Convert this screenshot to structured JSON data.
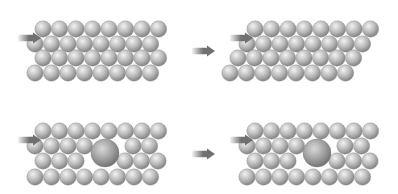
{
  "colors": {
    "background": "#ffffff",
    "sphere_light": "#f2f2f2",
    "sphere_mid": "#b8b8b8",
    "sphere_dark": "#7c7c7c",
    "big_sphere_light": "#d8d8d8",
    "big_sphere_mid": "#9a9a9a",
    "big_sphere_dark": "#6c6c6c",
    "arrow_light": "#f4f4f4",
    "arrow_dark": "#707070"
  },
  "sphere_radius": 8.2,
  "panels": [
    {
      "name": "perfect-lattice-before-slip",
      "rows": [
        {
          "y": 29,
          "x": [
            43,
            59.5,
            76,
            92.5,
            109,
            125.5,
            142,
            158.5
          ]
        },
        {
          "y": 44,
          "x": [
            35,
            51.5,
            68,
            84.5,
            101,
            117.5,
            134,
            150.5
          ]
        },
        {
          "y": 58,
          "x": [
            43,
            59.5,
            76,
            92.5,
            109,
            125.5,
            142,
            158.5
          ]
        },
        {
          "y": 73,
          "x": [
            35,
            51.5,
            68,
            84.5,
            101,
            117.5,
            134,
            150.5
          ]
        }
      ],
      "big": [],
      "push_arrow": {
        "x1": 18,
        "x2": 41,
        "y": 38
      }
    },
    {
      "name": "perfect-lattice-after-slip",
      "rows": [
        {
          "y": 29,
          "x": [
            255,
            271.5,
            288,
            304.5,
            321,
            337.5,
            354,
            370.5
          ]
        },
        {
          "y": 44,
          "x": [
            247,
            263.5,
            280,
            296.5,
            313,
            329.5,
            346,
            362.5
          ]
        },
        {
          "y": 58,
          "x": [
            238,
            254.5,
            271,
            287.5,
            304,
            320.5,
            337,
            353.5
          ]
        },
        {
          "y": 73,
          "x": [
            230,
            246.5,
            263,
            279.5,
            296,
            312.5,
            329,
            345.5
          ]
        }
      ],
      "big": [],
      "push_arrow": {
        "x1": 230,
        "x2": 253,
        "y": 38
      }
    },
    {
      "name": "lattice-with-impurity-before",
      "rows": [
        {
          "y": 131,
          "x": [
            43,
            59.5,
            76,
            92.5,
            109,
            125.5,
            142,
            158.5
          ]
        },
        {
          "y": 146,
          "x": [
            35,
            51.5,
            68,
            84.5,
            133,
            149.5
          ]
        },
        {
          "y": 161,
          "x": [
            43,
            59.5,
            76,
            125,
            141.5,
            158
          ]
        },
        {
          "y": 177,
          "x": [
            35,
            51.5,
            68,
            84.5,
            101,
            117.5,
            134,
            150.5
          ]
        }
      ],
      "big": [
        {
          "x": 105,
          "y": 153,
          "r": 14
        }
      ],
      "push_arrow": {
        "x1": 18,
        "x2": 41,
        "y": 140
      }
    },
    {
      "name": "lattice-with-impurity-after",
      "rows": [
        {
          "y": 131,
          "x": [
            255,
            271.5,
            288,
            304.5,
            321,
            337.5,
            354,
            370.5
          ]
        },
        {
          "y": 146,
          "x": [
            247,
            263.5,
            280,
            296.5,
            345,
            361.5
          ]
        },
        {
          "y": 161,
          "x": [
            255,
            271.5,
            288,
            337,
            353.5,
            370
          ]
        },
        {
          "y": 177,
          "x": [
            247,
            263.5,
            280,
            296.5,
            313,
            329.5,
            346,
            362.5
          ]
        }
      ],
      "big": [
        {
          "x": 317,
          "y": 153,
          "r": 14
        }
      ],
      "push_arrow": {
        "x1": 230,
        "x2": 253,
        "y": 140
      }
    }
  ],
  "transition_arrows": [
    {
      "name": "transition-arrow-top",
      "x1": 192,
      "x2": 215,
      "y": 51
    },
    {
      "name": "transition-arrow-bottom",
      "x1": 192,
      "x2": 215,
      "y": 154
    }
  ]
}
